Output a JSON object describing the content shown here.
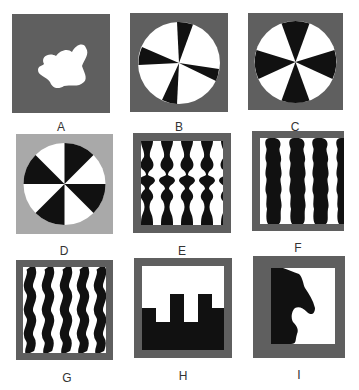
{
  "figure": {
    "colors": {
      "dark_gray": "#5f5f5f",
      "light_gray": "#a9a9a9",
      "black": "#111111",
      "white": "#ffffff",
      "label": "#333333"
    },
    "panels": [
      {
        "id": "A",
        "label": "A",
        "description": "white irregular blob on dark gray background"
      },
      {
        "id": "B",
        "label": "B",
        "description": "circle with asymmetric black and white sectors on dark gray background"
      },
      {
        "id": "C",
        "label": "C",
        "description": "circle with symmetric black and white sectors on dark gray background"
      },
      {
        "id": "D",
        "label": "D",
        "description": "circle with black and white sectors on light gray background"
      },
      {
        "id": "E",
        "label": "E",
        "description": "symmetric vertical black ornamental columns on white, dark gray frame"
      },
      {
        "id": "F",
        "label": "F",
        "description": "wavy irregular black vertical bands on white, dark gray frame"
      },
      {
        "id": "G",
        "label": "G",
        "description": "wavy black vertical stripes on white, dark gray frame"
      },
      {
        "id": "H",
        "label": "H",
        "description": "black crenellated shape at bottom, white above, dark gray frame"
      },
      {
        "id": "I",
        "label": "I",
        "description": "black knight-like silhouette on left, white on right, dark gray frame"
      }
    ]
  }
}
